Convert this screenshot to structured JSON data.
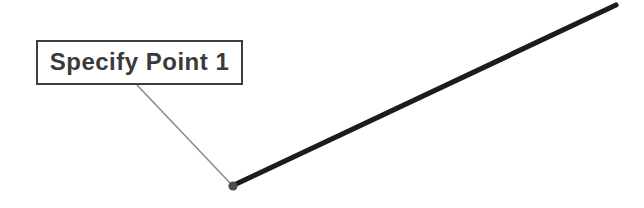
{
  "figure": {
    "callout": {
      "label": "Specify Point 1"
    },
    "elements": {
      "line_segment": "thick straight line from point marker to upper right",
      "point_marker": "small filled dot at line start point",
      "leader_line": "thin callout leader from label box to point marker"
    },
    "colors": {
      "background": "#ffffff",
      "line_segment": "#1c1c1c",
      "leader_line": "#8c8c8c",
      "point_marker": "#4d4d4d",
      "box_border": "#3d3d3d",
      "box_fill": "#ffffff",
      "label_text": "#3a3a3a"
    }
  }
}
